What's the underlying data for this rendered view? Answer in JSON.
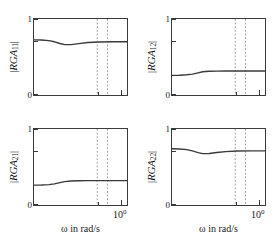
{
  "figure": {
    "background_color": "#ffffff",
    "line_color": "#3a3a3a",
    "dotted_line_color": "#808080",
    "axis_color": "#3a3a3a"
  },
  "chart_data": [
    {
      "type": "line",
      "panel_id": "rga11",
      "title": "",
      "ylabel": "|RGA_11|",
      "ylabel_parts": {
        "open_bar": "|",
        "name": "RGA",
        "sub": "11",
        "close_bar": "|"
      },
      "xlabel": "",
      "xscale": "log",
      "ylim": [
        0,
        1
      ],
      "yticks": [
        0,
        1
      ],
      "ytick_labels": [
        "0",
        "1"
      ],
      "xtick_labels": [],
      "grid": false,
      "legend": null,
      "annotations": {
        "vlines": [
          0.68,
          0.79
        ]
      },
      "x": [
        0.0,
        0.08,
        0.16,
        0.22,
        0.28,
        0.33,
        0.4,
        0.48,
        0.58,
        0.7,
        0.85,
        1.0
      ],
      "values": [
        0.725,
        0.723,
        0.715,
        0.7,
        0.678,
        0.663,
        0.663,
        0.676,
        0.69,
        0.698,
        0.7,
        0.7
      ]
    },
    {
      "type": "line",
      "panel_id": "rga12",
      "title": "",
      "ylabel": "|RGA_12|",
      "ylabel_parts": {
        "open_bar": "|",
        "name": "RGA",
        "sub": "12",
        "close_bar": "|"
      },
      "xlabel": "",
      "xscale": "log",
      "ylim": [
        0,
        1
      ],
      "yticks": [
        0,
        1
      ],
      "ytick_labels": [
        "0",
        "1"
      ],
      "xtick_labels": [],
      "grid": false,
      "legend": null,
      "annotations": {
        "vlines": [
          0.68,
          0.79
        ]
      },
      "x": [
        0.0,
        0.08,
        0.16,
        0.22,
        0.28,
        0.33,
        0.4,
        0.48,
        0.58,
        0.7,
        0.85,
        1.0
      ],
      "values": [
        0.258,
        0.26,
        0.266,
        0.275,
        0.292,
        0.306,
        0.312,
        0.314,
        0.315,
        0.315,
        0.315,
        0.315
      ]
    },
    {
      "type": "line",
      "panel_id": "rga21",
      "title": "",
      "ylabel": "|RGA_21|",
      "ylabel_parts": {
        "open_bar": "|",
        "name": "RGA",
        "sub": "21",
        "close_bar": "|"
      },
      "xlabel": "ω  in rad/s",
      "xscale": "log",
      "ylim": [
        0,
        1
      ],
      "yticks": [
        0,
        1
      ],
      "ytick_labels": [
        "0",
        "1"
      ],
      "xtick_labels": [
        "10^0"
      ],
      "grid": false,
      "legend": null,
      "annotations": {
        "vlines": [
          0.68,
          0.79
        ]
      },
      "x": [
        0.0,
        0.08,
        0.16,
        0.22,
        0.28,
        0.33,
        0.4,
        0.48,
        0.58,
        0.7,
        0.85,
        1.0
      ],
      "values": [
        0.262,
        0.263,
        0.268,
        0.278,
        0.294,
        0.308,
        0.316,
        0.32,
        0.321,
        0.321,
        0.321,
        0.321
      ]
    },
    {
      "type": "line",
      "panel_id": "rga22",
      "title": "",
      "ylabel": "|RGA_22|",
      "ylabel_parts": {
        "open_bar": "|",
        "name": "RGA",
        "sub": "22",
        "close_bar": "|"
      },
      "xlabel": "ω  in rad/s",
      "xscale": "log",
      "ylim": [
        0,
        1
      ],
      "yticks": [
        0,
        1
      ],
      "ytick_labels": [
        "0",
        "1"
      ],
      "xtick_labels": [
        "10^0"
      ],
      "grid": false,
      "legend": null,
      "annotations": {
        "vlines": [
          0.68,
          0.79
        ]
      },
      "x": [
        0.0,
        0.08,
        0.16,
        0.22,
        0.28,
        0.33,
        0.4,
        0.48,
        0.58,
        0.7,
        0.85,
        1.0
      ],
      "values": [
        0.74,
        0.737,
        0.728,
        0.712,
        0.69,
        0.676,
        0.678,
        0.69,
        0.702,
        0.71,
        0.712,
        0.712
      ]
    }
  ],
  "labels": {
    "xtick_mantissa": "10",
    "xtick_exponent": "0",
    "xaxis_text": "ω  in rad/s",
    "ytick_top": "1",
    "ytick_bottom": "0"
  }
}
